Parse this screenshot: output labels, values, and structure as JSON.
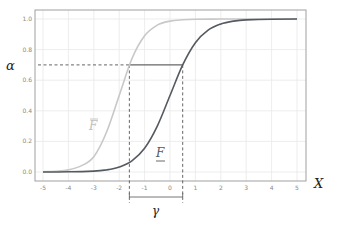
{
  "chart_data": {
    "type": "line",
    "title": "",
    "xlabel": "X",
    "ylabel": "α",
    "xlim": [
      -5,
      5
    ],
    "ylim": [
      0,
      1
    ],
    "grid": true,
    "legend": "none",
    "x_ticks": [
      "-5",
      "-4",
      "-3",
      "-2",
      "-1",
      "0",
      "1",
      "2",
      "3",
      "4",
      "5"
    ],
    "y_ticks": [
      "0.0",
      "0.2",
      "0.4",
      "0.6",
      "0.8",
      "1.0"
    ],
    "series": [
      {
        "name": "F̄ (upper distribution)",
        "label": "F",
        "label_decoration": "overline",
        "color": "#c8c8c8",
        "x": [
          -5,
          -4.5,
          -4,
          -3.5,
          -3,
          -2.5,
          -2,
          -1.5,
          -1,
          -0.5,
          0,
          0.5,
          1,
          2,
          3,
          4,
          5
        ],
        "y": [
          0.002,
          0.005,
          0.014,
          0.04,
          0.1,
          0.26,
          0.5,
          0.74,
          0.89,
          0.96,
          0.986,
          0.995,
          0.998,
          1.0,
          1.0,
          1.0,
          1.0
        ]
      },
      {
        "name": "F (lower distribution)",
        "label": "F",
        "label_decoration": "underline",
        "color": "#555a60",
        "x": [
          -5,
          -4,
          -3,
          -2.5,
          -2,
          -1.5,
          -1,
          -0.5,
          0,
          0.5,
          1,
          1.5,
          2,
          2.5,
          3,
          4,
          5
        ],
        "y": [
          0.0,
          0.001,
          0.006,
          0.014,
          0.033,
          0.073,
          0.155,
          0.3,
          0.5,
          0.7,
          0.845,
          0.927,
          0.967,
          0.986,
          0.994,
          0.999,
          1.0
        ]
      }
    ],
    "annotations": {
      "alpha_level": 0.7,
      "alpha_label": "α",
      "x_left": -1.6,
      "x_right": 0.5,
      "gamma_label": "γ",
      "x_axis_label": "X"
    }
  },
  "colors": {
    "frame": "#a0a0a0",
    "grid": "#e8e8e8",
    "tick_text": "#888888",
    "dashed": "#555555",
    "connector": "#666666",
    "upper_curve": "#c8c8c8",
    "lower_curve": "#555a60",
    "upper_label": "#c0c0c0",
    "lower_label": "#555a60",
    "math_label": "#222222"
  }
}
